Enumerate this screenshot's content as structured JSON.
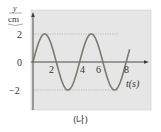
{
  "chart_data": {
    "type": "line",
    "title": "",
    "caption": "(나)",
    "xlabel": "t(s)",
    "ylabel_top": "y",
    "ylabel_bottom": "cm",
    "xlim": [
      0,
      8.3
    ],
    "ylim": [
      -3.5,
      3.5
    ],
    "x_ticks": [
      "2",
      "4",
      "6",
      "8"
    ],
    "y_ticks": [
      "2",
      "0",
      "−2"
    ],
    "grid": false,
    "reference_lines": [
      {
        "y": 2,
        "style": "dotted"
      },
      {
        "y": -2,
        "style": "dotted"
      }
    ],
    "series": [
      {
        "name": "displacement",
        "function": "y = 2 sin(πt/2)",
        "amplitude": 2,
        "period": 4,
        "x": [
          0,
          1,
          2,
          3,
          4,
          5,
          6,
          7,
          8,
          8.3
        ],
        "values": [
          0,
          2,
          0,
          -2,
          0,
          2,
          0,
          -2,
          0,
          0.9
        ]
      }
    ],
    "colors": {
      "plot_background": "#e6e6e6",
      "curve": "#7a7a6e",
      "axis": "#3a3a3a"
    }
  }
}
